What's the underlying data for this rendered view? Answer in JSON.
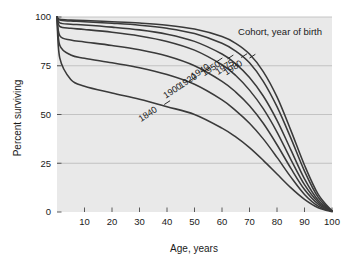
{
  "chart_data": {
    "type": "line",
    "title": "",
    "xlabel": "Age, years",
    "ylabel": "Percent surviving",
    "xlim": [
      0,
      100
    ],
    "ylim": [
      0,
      100
    ],
    "xticks": [
      10,
      20,
      30,
      40,
      50,
      60,
      70,
      80,
      90,
      100
    ],
    "yticks": [
      0,
      25,
      50,
      75,
      100
    ],
    "grid": "horizontal",
    "legend_title": "Cohort, year of birth",
    "legend_position": "inline-curve-labels",
    "x": [
      0,
      1,
      5,
      10,
      20,
      30,
      40,
      50,
      60,
      65,
      70,
      75,
      80,
      85,
      90,
      95,
      100
    ],
    "series": [
      {
        "name": "1980",
        "label": "1980",
        "values": [
          100,
          98.8,
          98.4,
          98.2,
          97.6,
          96.9,
          95.8,
          93.8,
          90.0,
          86.5,
          81.0,
          72.0,
          59.0,
          42.0,
          24.0,
          9.0,
          0.5
        ]
      },
      {
        "name": "1975",
        "label": "1975",
        "values": [
          100,
          98.4,
          97.9,
          97.6,
          96.8,
          95.8,
          94.2,
          91.5,
          86.5,
          82.5,
          76.5,
          67.0,
          54.0,
          38.0,
          21.0,
          7.5,
          0.5
        ]
      },
      {
        "name": "1950",
        "label": "1950",
        "values": [
          100,
          97.0,
          96.3,
          95.9,
          94.8,
          93.4,
          91.2,
          87.5,
          81.0,
          76.0,
          69.0,
          59.5,
          47.0,
          32.0,
          17.0,
          6.0,
          0.4
        ]
      },
      {
        "name": "1940",
        "label": "1940",
        "values": [
          100,
          95.2,
          94.2,
          93.6,
          92.2,
          90.3,
          87.5,
          83.0,
          75.5,
          70.0,
          62.5,
          53.0,
          41.0,
          27.0,
          14.0,
          5.0,
          0.4
        ]
      },
      {
        "name": "1920",
        "label": "1920",
        "values": [
          100,
          90.5,
          88.2,
          87.2,
          85.4,
          83.2,
          80.0,
          75.0,
          67.0,
          61.5,
          54.5,
          45.5,
          34.5,
          22.5,
          11.5,
          4.0,
          0.3
        ]
      },
      {
        "name": "1900",
        "label": "1900",
        "values": [
          100,
          85.5,
          80.5,
          78.8,
          76.5,
          74.0,
          70.5,
          65.5,
          57.5,
          52.0,
          45.5,
          37.5,
          28.0,
          18.0,
          9.0,
          3.0,
          0.3
        ]
      },
      {
        "name": "1840",
        "label": "1840",
        "values": [
          100,
          79.0,
          68.0,
          64.5,
          61.0,
          57.8,
          54.0,
          50.0,
          43.0,
          38.5,
          33.0,
          26.5,
          19.5,
          12.5,
          6.5,
          2.2,
          0.2
        ]
      }
    ]
  },
  "axes": {
    "y_title": "Percent surviving",
    "x_title": "Age, years",
    "y_tick_labels": [
      "0",
      "25",
      "50",
      "75",
      "100"
    ],
    "x_tick_labels": [
      "10",
      "20",
      "30",
      "40",
      "50",
      "60",
      "70",
      "80",
      "90",
      "100"
    ]
  },
  "legend": {
    "title": "Cohort, year of birth",
    "entries": [
      "1980",
      "1975",
      "1950",
      "1940",
      "1920",
      "1900",
      "1840"
    ]
  },
  "colors": {
    "plot_background": "#e9e9e9",
    "page_background": "#ffffff",
    "curve": "#3a3a3a",
    "gridline": "#b9b9b9",
    "text": "#1a1a1a"
  }
}
